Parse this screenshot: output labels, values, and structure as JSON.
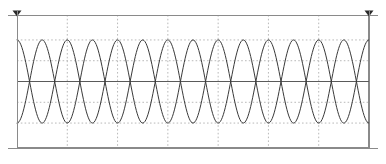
{
  "chart_data": {
    "type": "line",
    "title": "",
    "subtitle": "",
    "xlabel": "",
    "ylabel": "",
    "grid": true,
    "grid_style": "dotted",
    "legend": "none",
    "xlim": [
      0,
      7
    ],
    "ylim": [
      -1.6,
      1.6
    ],
    "x_tick_labels": [],
    "y_tick_labels": [],
    "x_gridlines": [
      1,
      2,
      3,
      4,
      5,
      6,
      7
    ],
    "y_gridlines": [
      -1.0,
      -0.5,
      0.5,
      1.0
    ],
    "zero_line": 0,
    "samples_per_series": 361,
    "series": [
      {
        "name": "waveform-a",
        "color": "#3a3a3a",
        "amplitude": 1.0,
        "cycles": 7,
        "phase_deg": 90,
        "linewidth": 1.0
      },
      {
        "name": "waveform-b",
        "color": "#3a3a3a",
        "amplitude": 1.0,
        "cycles": 7,
        "phase_deg": 270,
        "linewidth": 1.0
      }
    ],
    "annotations": [
      {
        "name": "marker-left",
        "shape": "triangle-down",
        "x": 0,
        "y": 1.6
      },
      {
        "name": "marker-right",
        "shape": "triangle-down",
        "x": 7,
        "y": 1.6
      }
    ]
  },
  "colors": {
    "background": "#ffffff",
    "border": "#8a8a8a",
    "grid": "#b9b9b9",
    "zero_line": "#5a5a5a",
    "trace": "#3a3a3a",
    "marker": "#2a2a2a"
  },
  "geometry": {
    "width": 386,
    "height": 164,
    "plot_left": 17,
    "plot_right": 369,
    "plot_top": 15,
    "plot_bottom": 148,
    "zero_y": 82,
    "top_rule_y": 15,
    "bottom_rule_y": 148
  }
}
